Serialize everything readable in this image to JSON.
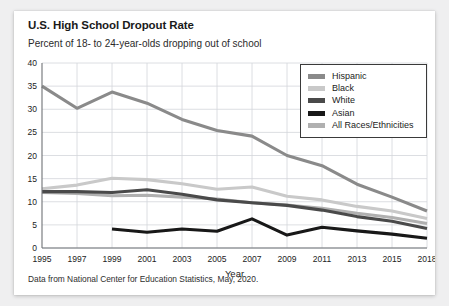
{
  "card": {
    "title": "U.S. High School Dropout Rate",
    "subtitle": "Percent of 18- to 24-year-olds dropping out of school",
    "source": "Data from National Center for Education Statistics, May, 2020."
  },
  "legend": {
    "items": [
      {
        "label": "Hispanic",
        "color": "#8a8a8a"
      },
      {
        "label": "Black",
        "color": "#c9c9c9"
      },
      {
        "label": "White",
        "color": "#4a4a4a"
      },
      {
        "label": "Asian",
        "color": "#181818"
      },
      {
        "label": "All Races/Ethnicities",
        "color": "#b0b0b0"
      }
    ]
  },
  "chart_data": {
    "type": "line",
    "title": "U.S. High School Dropout Rate",
    "subtitle": "Percent of 18- to 24-year-olds dropping out of school",
    "xlabel": "Year",
    "ylabel": "",
    "ylim": [
      0,
      40
    ],
    "ytick_step": 5,
    "yticks": [
      0,
      5,
      10,
      15,
      20,
      25,
      30,
      35,
      40
    ],
    "grid": true,
    "legend_position": "top-right",
    "categories": [
      1995,
      1997,
      1999,
      2001,
      2003,
      2005,
      2007,
      2009,
      2011,
      2013,
      2015,
      2018
    ],
    "tick_labels": [
      "1995",
      "1997",
      "1999",
      "2001",
      "2003",
      "2005",
      "2007",
      "2009",
      "2011",
      "2013",
      "2015",
      "2018"
    ],
    "series": [
      {
        "name": "Hispanic",
        "color": "#8a8a8a",
        "values": [
          35.0,
          30.2,
          33.7,
          31.3,
          27.8,
          25.4,
          24.2,
          20.0,
          17.8,
          13.8,
          11.0,
          8.0
        ]
      },
      {
        "name": "Black",
        "color": "#c9c9c9",
        "values": [
          12.8,
          13.6,
          15.1,
          14.8,
          13.9,
          12.7,
          13.2,
          11.2,
          10.4,
          9.0,
          8.0,
          6.4
        ]
      },
      {
        "name": "White",
        "color": "#4a4a4a",
        "values": [
          12.2,
          12.2,
          12.0,
          12.6,
          11.6,
          10.4,
          9.8,
          9.2,
          8.2,
          6.8,
          5.8,
          4.2
        ]
      },
      {
        "name": "Asian",
        "color": "#181818",
        "values": [
          null,
          null,
          4.1,
          3.4,
          4.1,
          3.6,
          6.3,
          2.8,
          4.5,
          3.7,
          3.0,
          2.1
        ]
      },
      {
        "name": "All Races/Ethnicities",
        "color": "#b0b0b0",
        "values": [
          12.0,
          11.8,
          11.3,
          11.4,
          11.0,
          10.6,
          9.8,
          9.3,
          8.6,
          7.5,
          6.6,
          5.3
        ]
      }
    ]
  }
}
